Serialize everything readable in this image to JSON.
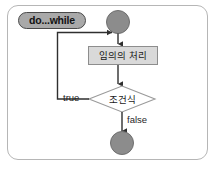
{
  "figure": {
    "title_pill": "do...while",
    "frame": {
      "border_color": "#b6b6b6"
    }
  },
  "colors": {
    "node_fill_gray": "#8c8c8c",
    "node_stroke": "#6d6d6d",
    "process_fill": "#d9d9d9",
    "process_stroke": "#8d8d8d",
    "decision_fill": "#ffffff",
    "decision_stroke": "#9a9a9a",
    "line": "#2f2f2f",
    "pill_fill": "#a9a9a9",
    "pill_stroke": "#4a4a4a"
  },
  "nodes": {
    "start": {
      "name": "start-node",
      "shape": "filled-circle"
    },
    "process": {
      "name": "process-node",
      "label": "임의의 처리",
      "shape": "rectangle"
    },
    "decision": {
      "name": "decision-node",
      "label": "조건식",
      "shape": "diamond"
    },
    "end": {
      "name": "end-node",
      "shape": "filled-circle"
    }
  },
  "edges": {
    "start_to_process": {
      "label": ""
    },
    "process_to_decision": {
      "label": ""
    },
    "decision_true_loop": {
      "label": "true"
    },
    "decision_false_exit": {
      "label": "false"
    }
  }
}
